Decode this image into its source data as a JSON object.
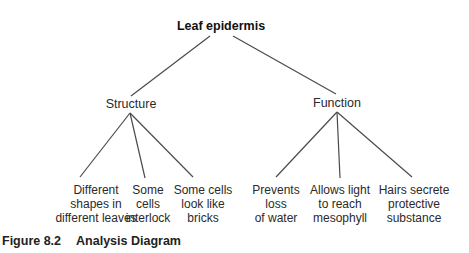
{
  "diagram": {
    "type": "tree",
    "root": {
      "label": "Leaf epidermis",
      "x": 221,
      "y": 19
    },
    "branches": [
      {
        "id": "structure",
        "label": "Structure",
        "x": 131,
        "y": 97,
        "edge_from_root": {
          "x1": 210,
          "y1": 36,
          "x2": 131,
          "y2": 96
        },
        "apex": {
          "x": 130,
          "y": 113
        },
        "children": [
          {
            "lines": [
              "Different",
              "shapes in",
              "different leaves"
            ],
            "x": 96,
            "y": 183,
            "edge_end": {
              "x": 80,
              "y": 177
            }
          },
          {
            "lines": [
              "Some",
              "cells",
              "interlock"
            ],
            "x": 148,
            "y": 183,
            "edge_end": {
              "x": 145,
              "y": 178
            }
          },
          {
            "lines": [
              "Some cells",
              "look like",
              "bricks"
            ],
            "x": 203,
            "y": 183,
            "edge_end": {
              "x": 193,
              "y": 177
            }
          }
        ]
      },
      {
        "id": "function",
        "label": "Function",
        "x": 337,
        "y": 96,
        "edge_from_root": {
          "x1": 233,
          "y1": 36,
          "x2": 336,
          "y2": 94
        },
        "apex": {
          "x": 337,
          "y": 112
        },
        "children": [
          {
            "lines": [
              "Prevents",
              "loss",
              "of water"
            ],
            "x": 276,
            "y": 183,
            "edge_end": {
              "x": 276,
              "y": 177
            }
          },
          {
            "lines": [
              "Allows light",
              "to reach",
              "mesophyll"
            ],
            "x": 340,
            "y": 183,
            "edge_end": {
              "x": 340,
              "y": 178
            }
          },
          {
            "lines": [
              "Hairs secrete",
              "protective",
              "substance"
            ],
            "x": 414,
            "y": 183,
            "edge_end": {
              "x": 412,
              "y": 177
            }
          }
        ]
      }
    ]
  },
  "caption": {
    "number": "Figure 8.2",
    "title": "Analysis Diagram"
  },
  "colors": {
    "edge": "#4a4a4a",
    "text": "#2a2a2a",
    "background": "#ffffff"
  }
}
